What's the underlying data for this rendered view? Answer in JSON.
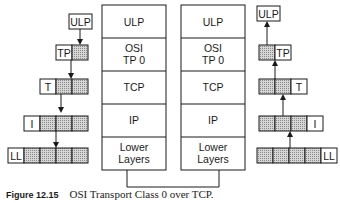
{
  "figure": {
    "label": "Figure 12.15",
    "caption": "OSI Transport Class 0 over TCP."
  },
  "stacks": {
    "left": {
      "layers": [
        {
          "lines": [
            "ULP"
          ]
        },
        {
          "lines": [
            "OSI",
            "TP 0"
          ]
        },
        {
          "lines": [
            "TCP"
          ]
        },
        {
          "lines": [
            "IP"
          ]
        },
        {
          "lines": [
            "Lower",
            "Layers"
          ]
        }
      ]
    },
    "right": {
      "layers": [
        {
          "lines": [
            "ULP"
          ]
        },
        {
          "lines": [
            "OSI",
            "TP 0"
          ]
        },
        {
          "lines": [
            "TCP"
          ]
        },
        {
          "lines": [
            "IP"
          ]
        },
        {
          "lines": [
            "Lower",
            "Layers"
          ]
        }
      ]
    }
  },
  "encapsulation": {
    "direction": "down",
    "headers": [
      "ULP",
      "TP",
      "T",
      "I",
      "LL"
    ]
  },
  "decapsulation": {
    "direction": "up",
    "headers": [
      "ULP",
      "TP",
      "T",
      "I",
      "LL"
    ]
  },
  "colors": {
    "line": "#1a1a1a",
    "shaded": "#bdbdbd"
  }
}
